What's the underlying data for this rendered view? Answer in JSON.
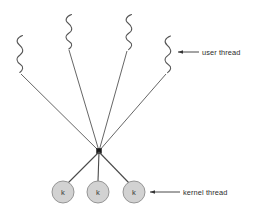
{
  "diagram": {
    "type": "many-to-one-threading-model",
    "canvas": {
      "width": 257,
      "height": 217,
      "background": "#ffffff"
    },
    "colors": {
      "line": "#4a4a4a",
      "squiggle": "#555555",
      "node_fill": "#d2d2d2",
      "node_stroke": "#8c8c8c",
      "hub": "#1a1a1a",
      "text": "#2b2b2b"
    },
    "hub": {
      "x": 99,
      "y": 151,
      "size": 5
    },
    "user_threads": [
      {
        "id": "user-thread-1",
        "squiggle_x": 19,
        "squiggle_top": 35,
        "squiggle_bottom": 72,
        "line_start_x": 21,
        "line_start_y": 74
      },
      {
        "id": "user-thread-2",
        "squiggle_x": 68,
        "squiggle_top": 14,
        "squiggle_bottom": 48,
        "line_start_x": 69,
        "line_start_y": 50
      },
      {
        "id": "user-thread-3",
        "squiggle_x": 128,
        "squiggle_top": 14,
        "squiggle_bottom": 49,
        "line_start_x": 127,
        "line_start_y": 51
      },
      {
        "id": "user-thread-4",
        "squiggle_x": 167,
        "squiggle_top": 36,
        "squiggle_bottom": 72,
        "line_start_x": 166,
        "line_start_y": 74
      }
    ],
    "kernel_threads": [
      {
        "id": "kernel-thread-1",
        "label": "k",
        "cx": 63,
        "cy": 192,
        "r": 11
      },
      {
        "id": "kernel-thread-2",
        "label": "k",
        "cx": 98,
        "cy": 192,
        "r": 11
      },
      {
        "id": "kernel-thread-3",
        "label": "k",
        "cx": 134,
        "cy": 192,
        "r": 11
      }
    ],
    "annotations": [
      {
        "id": "user-thread-annotation",
        "label": "user thread",
        "arrow_tip_x": 178,
        "arrow_tail_x": 199,
        "arrow_y": 52,
        "text_x": 202,
        "text_y": 55
      },
      {
        "id": "kernel-thread-annotation",
        "label": "kernel thread",
        "arrow_tip_x": 150,
        "arrow_tail_x": 180,
        "arrow_y": 192,
        "text_x": 183,
        "text_y": 195
      }
    ]
  }
}
